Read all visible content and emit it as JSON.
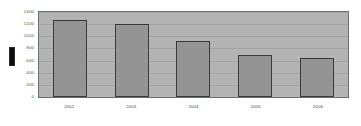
{
  "chart_data": {
    "type": "bar",
    "title": "",
    "xlabel": "",
    "ylabel": "",
    "categories": [
      "2002",
      "2003",
      "2004",
      "2005",
      "2006"
    ],
    "values": [
      1275,
      1200,
      920,
      690,
      650
    ],
    "ylim": [
      0,
      1400
    ],
    "yticks": [
      "0",
      "200",
      "400",
      "600",
      "800",
      "1000",
      "1200",
      "1400"
    ],
    "ytick_values": [
      0,
      200,
      400,
      600,
      800,
      1000,
      1200,
      1400
    ],
    "grid": true,
    "legend": "none",
    "colors": {
      "bar_fill": "#949494",
      "bar_border": "#3a3a3a",
      "plot_background": "#b3b3b3",
      "plot_border": "#6e6e6e",
      "gridline": "#a3a3a3",
      "tick_label": "#4a4a4a",
      "marker": "#0d0d0d",
      "page_background": "#ffffff"
    }
  },
  "annotations": {
    "left_marker": "black-rectangle-marker"
  }
}
